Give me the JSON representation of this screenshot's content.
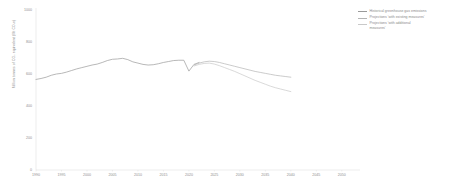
{
  "chart_data": {
    "type": "line",
    "title": "",
    "xlabel": "",
    "ylabel": "Million tonnes of CO₂ equivalent (Mt CO₂e)",
    "xlim": [
      1990,
      2052
    ],
    "ylim": [
      0,
      1000
    ],
    "grid": false,
    "legend_position": "right",
    "x_ticks": [
      "1990",
      "1995",
      "2000",
      "2005",
      "2010",
      "2015",
      "2020",
      "2025",
      "2030",
      "2035",
      "2040",
      "2045",
      "2050"
    ],
    "y_ticks": [
      "0",
      "200",
      "400",
      "600",
      "800",
      "1000"
    ],
    "series": [
      {
        "name": "Historical greenhouse gas emissions",
        "color": "#9a9a9a",
        "style": "solid",
        "x": [
          1990,
          1991,
          1992,
          1993,
          1994,
          1995,
          1996,
          1997,
          1998,
          1999,
          2000,
          2001,
          2002,
          2003,
          2004,
          2005,
          2006,
          2007,
          2008,
          2009,
          2010,
          2011,
          2012,
          2013,
          2014,
          2015,
          2016,
          2017,
          2018,
          2019,
          2020,
          2021,
          2022
        ],
        "values": [
          566,
          572,
          580,
          592,
          600,
          604,
          612,
          622,
          632,
          640,
          648,
          656,
          662,
          672,
          684,
          692,
          694,
          698,
          690,
          676,
          668,
          660,
          656,
          658,
          664,
          672,
          678,
          684,
          686,
          686,
          618,
          660,
          672
        ]
      },
      {
        "name": "Projections 'with existing measures'",
        "color": "#b4b4b4",
        "style": "solid",
        "x": [
          2021,
          2022,
          2023,
          2024,
          2025,
          2026,
          2027,
          2028,
          2029,
          2030,
          2031,
          2032,
          2033,
          2034,
          2035,
          2036,
          2037,
          2038,
          2039,
          2040
        ],
        "values": [
          656,
          668,
          676,
          680,
          678,
          672,
          664,
          656,
          648,
          640,
          632,
          624,
          616,
          610,
          604,
          598,
          592,
          588,
          584,
          580
        ]
      },
      {
        "name": "Projections 'with additional measures'",
        "color": "#c9c9c9",
        "style": "solid",
        "x": [
          2021,
          2022,
          2023,
          2024,
          2025,
          2026,
          2027,
          2028,
          2029,
          2030,
          2031,
          2032,
          2033,
          2034,
          2035,
          2036,
          2037,
          2038,
          2039,
          2040
        ],
        "values": [
          650,
          660,
          666,
          668,
          662,
          652,
          640,
          628,
          616,
          602,
          588,
          574,
          560,
          548,
          536,
          524,
          514,
          506,
          498,
          490
        ]
      }
    ]
  },
  "legend": {
    "items": [
      {
        "label": "Historical greenhouse gas emissions",
        "color": "#9a9a9a"
      },
      {
        "label": "Projections 'with existing measures'",
        "color": "#b4b4b4"
      },
      {
        "label": "Projections 'with additional\nmeasures'",
        "color": "#c9c9c9"
      }
    ]
  }
}
